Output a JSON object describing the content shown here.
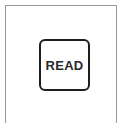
{
  "panel": {
    "button": {
      "label": "READ"
    }
  },
  "colors": {
    "frame": "#9a9a9a",
    "button_border": "#1e1e1e",
    "button_text": "#2a2a2a",
    "background": "#ffffff"
  }
}
